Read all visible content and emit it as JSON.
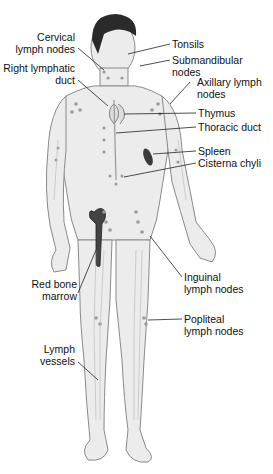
{
  "figure": {
    "labels": {
      "cervical": [
        "Cervical",
        "lymph nodes"
      ],
      "right_lymphatic_duct": [
        "Right lymphatic",
        "duct"
      ],
      "tonsils": [
        "Tonsils"
      ],
      "submandibular": [
        "Submandibular",
        "nodes"
      ],
      "axillary": [
        "Axillary lymph",
        "nodes"
      ],
      "thymus": [
        "Thymus"
      ],
      "thoracic_duct": [
        "Thoracic duct"
      ],
      "spleen": [
        "Spleen"
      ],
      "cisterna_chyli": [
        "Cisterna chyli"
      ],
      "red_bone_marrow": [
        "Red bone",
        "marrow"
      ],
      "inguinal": [
        "Inguinal",
        "lymph nodes"
      ],
      "popliteal": [
        "Popliteal",
        "lymph nodes"
      ],
      "lymph_vessels": [
        "Lymph",
        "vessels"
      ]
    },
    "colors": {
      "skin": "#ececec",
      "outline": "#8a8a8a",
      "hair": "#2a2a2a",
      "node": "#9a9a9a",
      "organ_dark": "#3a3a3a",
      "leader": "#222222",
      "text": "#111111"
    }
  }
}
